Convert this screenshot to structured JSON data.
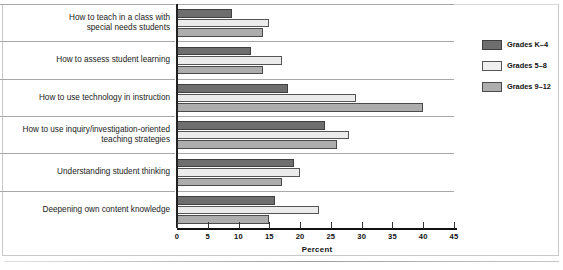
{
  "chart_data": {
    "type": "bar",
    "orientation": "horizontal",
    "title": "",
    "xlabel": "Percent",
    "ylabel": "",
    "xlim": [
      0,
      45
    ],
    "xticks": [
      0,
      5,
      10,
      15,
      20,
      25,
      30,
      35,
      40,
      45
    ],
    "grid": false,
    "legend_position": "right",
    "categories": [
      "How to teach in a class with\nspecial needs students",
      "How to assess student learning",
      "How to use technology in instruction",
      "How to use inquiry/investigation-oriented\nteaching strategies",
      "Understanding student thinking",
      "Deepening own content knowledge"
    ],
    "series": [
      {
        "name": "Grades K–4",
        "color": "#6e6e6e",
        "values": [
          9,
          12,
          18,
          24,
          19,
          16
        ]
      },
      {
        "name": "Grades 5–8",
        "color": "#ebebeb",
        "values": [
          15,
          17,
          29,
          28,
          20,
          23
        ]
      },
      {
        "name": "Grades 9–12",
        "color": "#adadad",
        "values": [
          14,
          14,
          40,
          26,
          17,
          15
        ]
      }
    ]
  },
  "legend": {
    "items": [
      {
        "label": "Grades K–4"
      },
      {
        "label": "Grades 5–8"
      },
      {
        "label": "Grades 9–12"
      }
    ]
  },
  "axis": {
    "title": "Percent",
    "ticks": [
      "0",
      "5",
      "10",
      "15",
      "20",
      "25",
      "30",
      "35",
      "40",
      "45"
    ]
  }
}
